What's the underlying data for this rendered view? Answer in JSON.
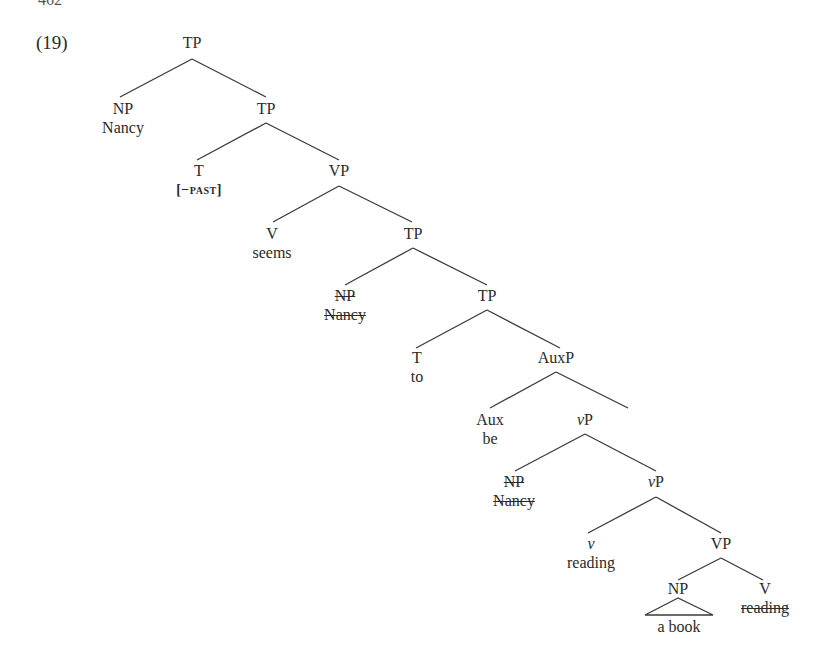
{
  "page_number": "462",
  "example_number": "(19)",
  "tree": {
    "nodes": [
      {
        "id": "tp1",
        "label": "TP",
        "x": 192,
        "y": 33
      },
      {
        "id": "np1",
        "label": "NP",
        "word": "Nancy",
        "x": 123,
        "y": 96
      },
      {
        "id": "tp2",
        "label": "TP",
        "x": 266,
        "y": 96
      },
      {
        "id": "t1",
        "label": "T",
        "word": "[−past]",
        "word_smallcaps": true,
        "x": 201,
        "y": 159
      },
      {
        "id": "vp1",
        "label": "VP",
        "x": 339,
        "y": 159
      },
      {
        "id": "v1",
        "label": "V",
        "word": "seems",
        "x": 272,
        "y": 223
      },
      {
        "id": "tp3",
        "label": "TP",
        "x": 413,
        "y": 223
      },
      {
        "id": "np2",
        "label": "NP",
        "word": "Nancy",
        "struck": true,
        "x": 345,
        "y": 285
      },
      {
        "id": "tp4",
        "label": "TP",
        "x": 486,
        "y": 285
      },
      {
        "id": "t2",
        "label": "T",
        "word": "to",
        "x": 417,
        "y": 346
      },
      {
        "id": "auxp",
        "label": "AuxP",
        "x": 556,
        "y": 346
      },
      {
        "id": "aux",
        "label": "Aux",
        "word": "be",
        "x": 490,
        "y": 409
      },
      {
        "id": "vsp1",
        "label": "vP",
        "italic_v": true,
        "x": 629,
        "y": 409
      },
      {
        "id": "np3",
        "label": "NP",
        "word": "Nancy",
        "struck": true,
        "x": 514,
        "y": 471
      },
      {
        "id": "vsp2",
        "label": "vP",
        "italic_v": true,
        "x": 656,
        "y": 471
      },
      {
        "id": "vs",
        "label": "v",
        "italic_v": true,
        "word": "reading",
        "x": 591,
        "y": 533
      },
      {
        "id": "vp2",
        "label": "VP",
        "x": 721,
        "y": 533
      },
      {
        "id": "np4",
        "label": "NP",
        "word": "a book",
        "triangle": true,
        "x": 678,
        "y": 594
      },
      {
        "id": "v2",
        "label": "V",
        "word": "reading",
        "word_struck": true,
        "x": 765,
        "y": 594
      }
    ]
  }
}
